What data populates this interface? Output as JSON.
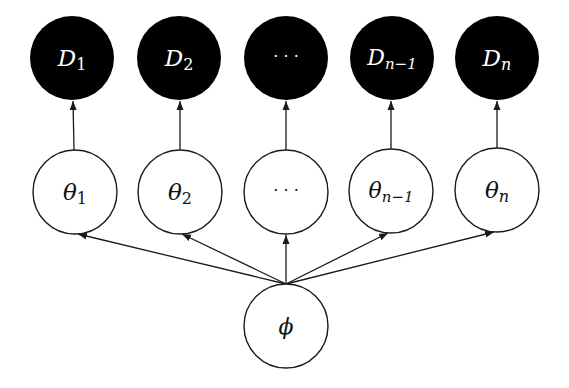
{
  "diagram": {
    "type": "hierarchical-bayesian-graphical-model",
    "colors": {
      "observed_fill": "#000000",
      "observed_text": "#ffffff",
      "latent_fill": "#ffffff",
      "stroke": "#1a1a1a",
      "text": "#111111"
    },
    "observed_nodes": [
      {
        "id": "D1",
        "symbol": "D",
        "subscript": "1",
        "cx": 72,
        "cy": 58
      },
      {
        "id": "D2",
        "symbol": "D",
        "subscript": "2",
        "cx": 179,
        "cy": 58
      },
      {
        "id": "Ddots",
        "symbol": "···",
        "subscript": "",
        "cx": 286,
        "cy": 58
      },
      {
        "id": "Dn-1",
        "symbol": "D",
        "subscript": "n−1",
        "cx": 392,
        "cy": 58
      },
      {
        "id": "Dn",
        "symbol": "D",
        "subscript": "n",
        "cx": 497,
        "cy": 58
      }
    ],
    "latent_nodes": [
      {
        "id": "theta1",
        "symbol": "θ",
        "subscript": "1",
        "cx": 75,
        "cy": 192
      },
      {
        "id": "theta2",
        "symbol": "θ",
        "subscript": "2",
        "cx": 180,
        "cy": 192
      },
      {
        "id": "thetadots",
        "symbol": "···",
        "subscript": "",
        "cx": 286,
        "cy": 192
      },
      {
        "id": "thetan-1",
        "symbol": "θ",
        "subscript": "n−1",
        "cx": 391,
        "cy": 191
      },
      {
        "id": "thetan",
        "symbol": "θ",
        "subscript": "n",
        "cx": 497,
        "cy": 190
      }
    ],
    "root_node": {
      "id": "phi",
      "symbol": "ϕ",
      "cx": 286,
      "cy": 326
    },
    "node_radius": 42,
    "edges": [
      {
        "from": "phi",
        "to": "theta1"
      },
      {
        "from": "phi",
        "to": "theta2"
      },
      {
        "from": "phi",
        "to": "thetadots"
      },
      {
        "from": "phi",
        "to": "thetan-1"
      },
      {
        "from": "phi",
        "to": "thetan"
      },
      {
        "from": "theta1",
        "to": "D1"
      },
      {
        "from": "theta2",
        "to": "D2"
      },
      {
        "from": "thetadots",
        "to": "Ddots"
      },
      {
        "from": "thetan-1",
        "to": "Dn-1"
      },
      {
        "from": "thetan",
        "to": "Dn"
      }
    ]
  },
  "labels": {
    "d1_sym": "D",
    "d1_sub": "1",
    "d2_sym": "D",
    "d2_sub": "2",
    "ddots": "· · ·",
    "dn1_sym": "D",
    "dn1_sub": "n−1",
    "dn_sym": "D",
    "dn_sub": "n",
    "t1_sym": "θ",
    "t1_sub": "1",
    "t2_sym": "θ",
    "t2_sub": "2",
    "tdots": "· · ·",
    "tn1_sym": "θ",
    "tn1_sub": "n−1",
    "tn_sym": "θ",
    "tn_sub": "n",
    "phi": "ϕ"
  }
}
